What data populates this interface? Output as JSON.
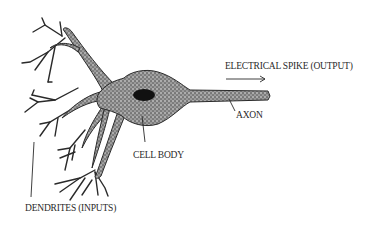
{
  "diagram": {
    "type": "neuron-illustration",
    "labels": {
      "output": "ELECTRICAL SPIKE (OUTPUT)",
      "axon": "AXON",
      "cell_body": "CELL BODY",
      "dendrites": "DENDRITES (INPUTS)"
    },
    "colors": {
      "ink": "#2a2a2a",
      "stipple": "#5a5a5a",
      "nucleus": "#111111",
      "background": "#ffffff"
    }
  }
}
